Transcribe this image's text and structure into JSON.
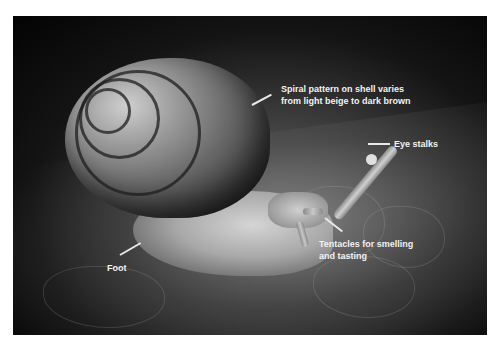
{
  "image": {
    "subject": "snail-on-leaf",
    "palette": {
      "background": "#ffffff",
      "photo_dark": "#030303",
      "label_text": "#f2f2f2",
      "leader_line": "#e8e8e8"
    }
  },
  "annotations": [
    {
      "id": "shell",
      "text": "Spiral pattern on shell varies\nfrom light beige to dark brown"
    },
    {
      "id": "eye-stalks",
      "text": "Eye stalks"
    },
    {
      "id": "tentacles",
      "text": "Tentacles for smelling\nand tasting"
    },
    {
      "id": "foot",
      "text": "Foot"
    }
  ]
}
